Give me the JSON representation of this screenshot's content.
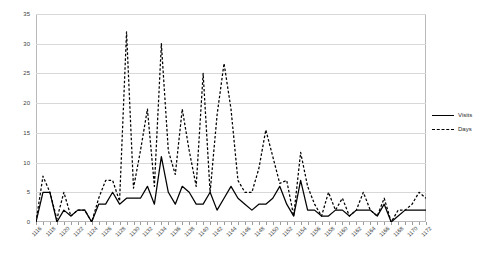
{
  "chart_data": {
    "type": "line",
    "title": "",
    "subtitle": "",
    "xlabel": "",
    "ylabel": "",
    "ylim": [
      0,
      35
    ],
    "y_ticks": [
      0,
      5,
      10,
      15,
      20,
      25,
      30,
      35
    ],
    "grid": true,
    "legend_position": "right",
    "background_color": "#ffffff",
    "gridline_color": "#d8d8d8",
    "axis_color": "#b9b9b9",
    "series_color": "#000000",
    "x_tick_step": 2,
    "x": [
      1116,
      1117,
      1118,
      1119,
      1120,
      1121,
      1122,
      1123,
      1124,
      1125,
      1126,
      1127,
      1128,
      1129,
      1130,
      1131,
      1132,
      1133,
      1134,
      1135,
      1136,
      1137,
      1138,
      1139,
      1140,
      1141,
      1142,
      1143,
      1144,
      1145,
      1146,
      1147,
      1148,
      1149,
      1150,
      1151,
      1152,
      1153,
      1154,
      1155,
      1156,
      1157,
      1158,
      1159,
      1160,
      1161,
      1162,
      1163,
      1164,
      1165,
      1166,
      1167,
      1168,
      1169,
      1170,
      1171,
      1172
    ],
    "x_tick_labels": [
      "1116",
      "1118",
      "1120",
      "1122",
      "1124",
      "1126",
      "1128",
      "1130",
      "1132",
      "1134",
      "1136",
      "1138",
      "1140",
      "1142",
      "1144",
      "1146",
      "1148",
      "1150",
      "1152",
      "1154",
      "1156",
      "1158",
      "1160",
      "1162",
      "1164",
      "1166",
      "1168",
      "1170",
      "1172"
    ],
    "series": [
      {
        "name": "Visits",
        "style": "solid",
        "color": "#000000",
        "values": [
          0,
          5,
          5,
          0,
          2,
          1,
          2,
          2,
          0,
          3,
          3,
          5,
          3,
          4,
          4,
          4,
          6,
          3,
          11,
          5,
          3,
          6,
          5,
          3,
          3,
          5,
          2,
          4,
          6,
          4,
          3,
          2,
          3,
          3,
          4,
          6,
          3,
          1,
          7,
          2,
          2,
          1,
          1,
          2,
          2,
          1,
          2,
          2,
          2,
          1,
          3,
          0,
          1,
          2,
          2,
          2,
          2
        ]
      },
      {
        "name": "Days",
        "style": "dashed",
        "color": "#000000",
        "values": [
          0,
          7.7,
          5,
          0.5,
          5,
          1,
          2,
          2,
          0,
          4,
          7,
          7,
          3.5,
          32,
          5.7,
          12,
          19,
          6,
          30,
          12,
          8,
          19,
          12,
          6,
          25,
          5,
          18,
          26.7,
          19,
          7,
          5,
          5,
          9,
          15.5,
          11,
          6.5,
          7,
          1,
          11.7,
          6,
          3,
          1,
          5,
          2,
          4,
          1,
          2,
          5,
          2,
          1,
          4,
          0,
          2,
          2,
          3,
          5,
          4
        ]
      }
    ]
  },
  "legend": {
    "items": [
      {
        "label": "Visits",
        "style": "solid"
      },
      {
        "label": "Days",
        "style": "dashed"
      }
    ]
  }
}
